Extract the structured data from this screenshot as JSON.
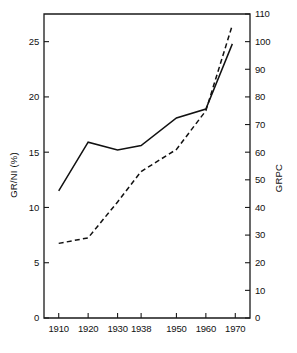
{
  "chart_data": {
    "type": "line",
    "title": "",
    "xlabel": "",
    "ylabel": "GR/NI (%)",
    "y2label": "GRPC",
    "grid": false,
    "legend": "none",
    "categories": [
      "1910",
      "1920",
      "1930",
      "1938",
      "1950",
      "1960",
      "1970"
    ],
    "x_tick_labels": [
      "1910",
      "1920",
      "1930",
      "1938",
      "1950",
      "1960",
      "1970"
    ],
    "x_tick_positions": [
      1910,
      1920,
      1930,
      1938,
      1950,
      1960,
      1970
    ],
    "xlim": [
      1905,
      1975
    ],
    "ylim": [
      0,
      27.5
    ],
    "y_ticks": [
      0,
      5,
      10,
      15,
      20,
      25
    ],
    "y_tick_labels": [
      "0",
      "5",
      "10",
      "15",
      "20",
      "25"
    ],
    "y2lim": [
      0,
      110
    ],
    "y2_ticks": [
      0,
      10,
      20,
      30,
      40,
      50,
      60,
      70,
      80,
      90,
      100,
      110
    ],
    "y2_tick_labels": [
      "0",
      "10",
      "20",
      "30",
      "40",
      "50",
      "60",
      "70",
      "80",
      "90",
      "100",
      "110"
    ],
    "series": [
      {
        "name": "GR/NI (%)",
        "axis": "left",
        "style": "solid",
        "x": [
          1910,
          1920,
          1930,
          1938,
          1950,
          1960,
          1969
        ],
        "values": [
          11.5,
          15.9,
          15.2,
          15.6,
          18.1,
          18.9,
          24.8
        ]
      },
      {
        "name": "GRPC",
        "axis": "right",
        "style": "dashed",
        "x": [
          1910,
          1920,
          1930,
          1938,
          1950,
          1960,
          1969
        ],
        "values": [
          27,
          29,
          42,
          53,
          61,
          75,
          106
        ]
      }
    ],
    "annotations": []
  },
  "axes": {
    "left_title": "GR/NI (%)",
    "right_title": "GRPC"
  }
}
